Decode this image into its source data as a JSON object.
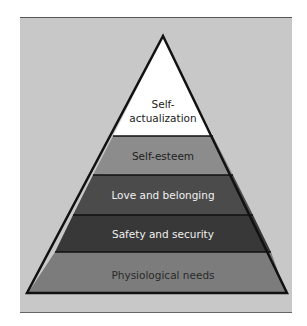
{
  "diagram": {
    "type": "pyramid",
    "colors": {
      "background": "#c8c8c8",
      "outline": "#111111"
    },
    "layers": [
      {
        "label_line1": "Self-",
        "label_line2": "actualization",
        "fill": "#ffffff",
        "text_color": "#222222"
      },
      {
        "label": "Self-esteem",
        "fill": "#8c8c8c",
        "text_color": "#222222"
      },
      {
        "label": "Love and belonging",
        "fill": "#4b4b4b",
        "text_color": "#f0f0f0"
      },
      {
        "label": "Safety and security",
        "fill": "#383838",
        "text_color": "#f0f0f0"
      },
      {
        "label": "Physiological needs",
        "fill": "#7c7c7c",
        "text_color": "#2a2a2a"
      }
    ]
  }
}
